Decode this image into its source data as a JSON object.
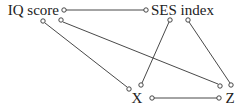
{
  "diagram": {
    "nodes": [
      {
        "id": "iq",
        "label": "IQ score"
      },
      {
        "id": "ses",
        "label": "SES index"
      },
      {
        "id": "x",
        "label": "X"
      },
      {
        "id": "z",
        "label": "Z"
      }
    ],
    "edges": [
      {
        "from": "iq",
        "to": "ses"
      },
      {
        "from": "iq",
        "to": "x"
      },
      {
        "from": "iq",
        "to": "z"
      },
      {
        "from": "ses",
        "to": "x"
      },
      {
        "from": "ses",
        "to": "z"
      },
      {
        "from": "x",
        "to": "z"
      }
    ],
    "edge_color": "#333333"
  }
}
